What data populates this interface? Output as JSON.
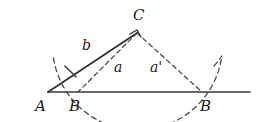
{
  "figure": {
    "kind": "geometry-diagram",
    "width": 264,
    "height": 122,
    "background_color": "#ffffff",
    "stroke_color": "#3a3a3a",
    "text_color": "#1a1a1a"
  },
  "labels": {
    "vertex_a": "A",
    "vertex_b_left": "B",
    "vertex_b_right": "B",
    "vertex_c": "C",
    "side_b": "b",
    "side_a": "a",
    "side_a_prime": "a'"
  },
  "geometry": {
    "baseline": {
      "x1": 48,
      "y1": 92,
      "x2": 250,
      "y2": 92
    },
    "point_a": {
      "x": 48,
      "y": 92
    },
    "point_c": {
      "x": 137,
      "y": 33
    },
    "point_b_left": {
      "x": 78,
      "y": 92
    },
    "point_b_right": {
      "x": 202,
      "y": 92
    },
    "solid_side_ac": {
      "x1": 48,
      "y1": 92,
      "x2": 137,
      "y2": 33
    },
    "dashed_segment_cb_left": {
      "x1": 137,
      "y1": 33,
      "x2": 78,
      "y2": 92
    },
    "dashed_segment_cb_right": {
      "x1": 137,
      "y1": 33,
      "x2": 202,
      "y2": 92
    },
    "compass_arc": {
      "center_x": 137,
      "center_y": 33,
      "radius": 85,
      "from_x": 52,
      "from_y": 33,
      "through_b_left": true,
      "through_b_right": true,
      "lowest_y": 118
    },
    "tick_mark_on_b": {
      "x": 70,
      "y": 72
    },
    "corner_mark_at_c": {
      "x": 137,
      "y": 33
    }
  },
  "label_positions": {
    "vertex_a": {
      "left": 35,
      "top": 99
    },
    "vertex_b_left": {
      "left": 69,
      "top": 99
    },
    "vertex_b_right": {
      "left": 200,
      "top": 99
    },
    "vertex_c": {
      "left": 133,
      "top": 8
    },
    "side_b": {
      "left": 82,
      "top": 38
    },
    "side_a": {
      "left": 114,
      "top": 60
    },
    "side_a_prime": {
      "left": 150,
      "top": 60
    }
  }
}
